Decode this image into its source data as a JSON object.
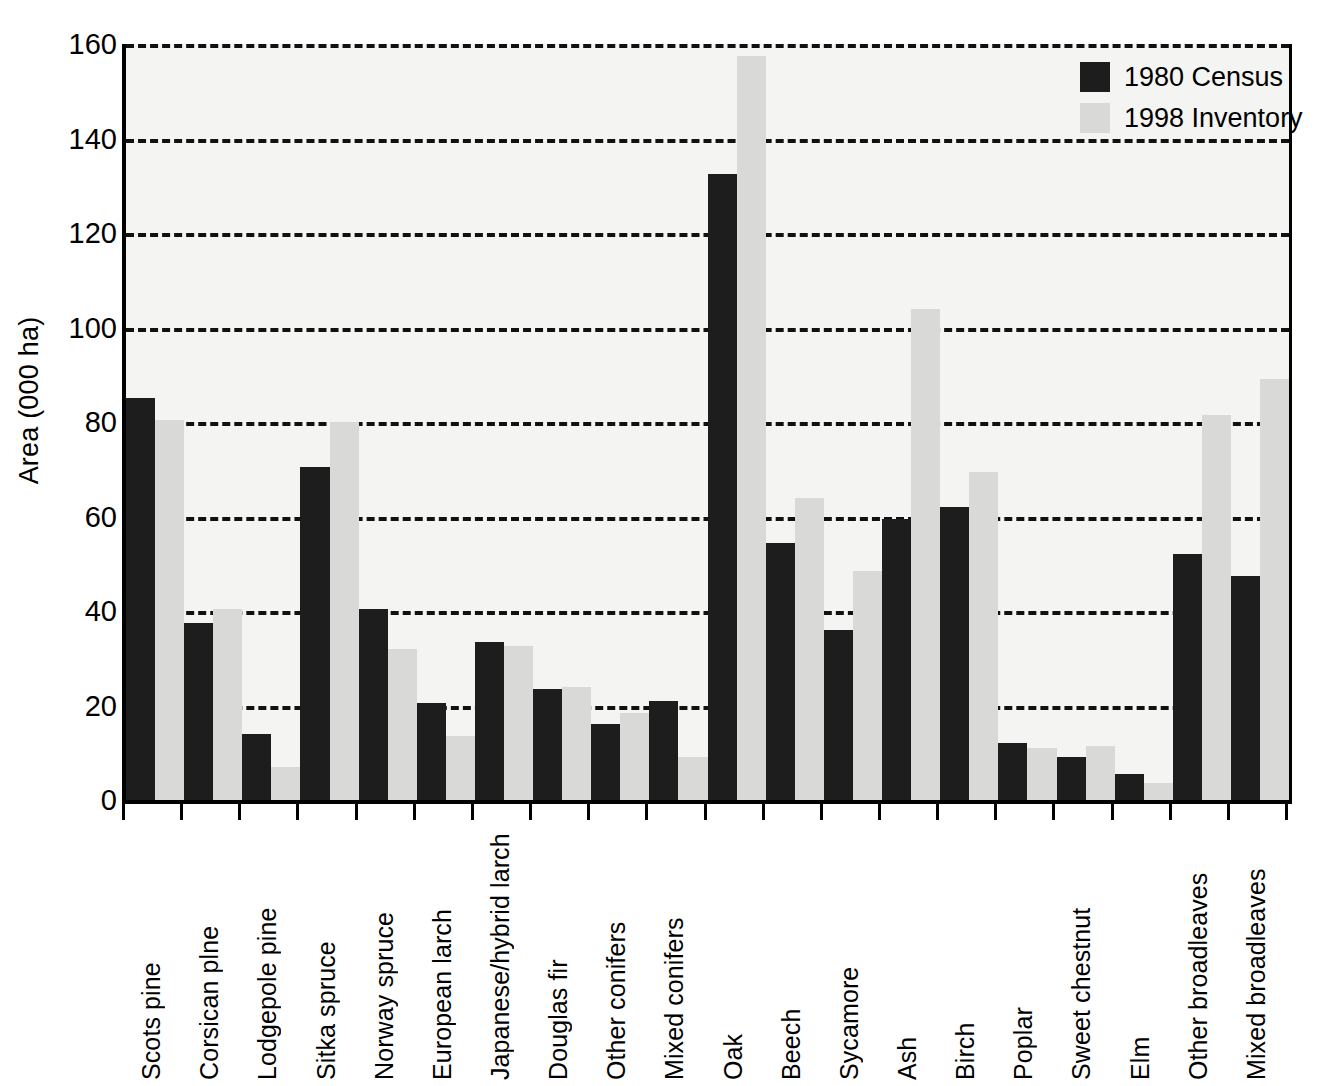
{
  "chart_data": {
    "type": "bar",
    "title": "",
    "xlabel": "",
    "ylabel": "Area (000 ha)",
    "ylim": [
      0,
      160
    ],
    "yticks": [
      0,
      20,
      40,
      60,
      80,
      100,
      120,
      140,
      160
    ],
    "ytick_labels": [
      "0",
      "20",
      "40",
      "60",
      "80",
      "100",
      "120",
      "140",
      "160"
    ],
    "grid": "horizontal-dashed",
    "legend_position": "top-right",
    "categories": [
      "Scots pine",
      "Corsican plne",
      "Lodgepole pine",
      "Sitka spruce",
      "Norway spruce",
      "European larch",
      "Japanese/hybrid larch",
      "Douglas fir",
      "Other conifers",
      "Mixed conifers",
      "Oak",
      "Beech",
      "Sycamore",
      "Ash",
      "Birch",
      "Poplar",
      "Sweet chestnut",
      "Elm",
      "Other broadleaves",
      "Mixed broadleaves"
    ],
    "series": [
      {
        "name": "1980 Census",
        "color": "#1d1d1d",
        "values": [
          85,
          37.5,
          14,
          70.5,
          40.5,
          20.5,
          33.5,
          23.5,
          16,
          21,
          132.5,
          54.5,
          36,
          59.5,
          62,
          12,
          9,
          5.5,
          52,
          47.5
        ]
      },
      {
        "name": "1998 Inventory",
        "color": "#d9d9d7",
        "values": [
          80.5,
          40.5,
          7,
          80,
          32,
          13.5,
          32.5,
          24,
          18.5,
          9,
          157.5,
          64,
          48.5,
          104,
          69.5,
          11,
          11.5,
          3.5,
          81.5,
          89
        ]
      }
    ]
  },
  "legend": {
    "items": [
      {
        "label": "1980 Census",
        "swatch": "series-1-swatch"
      },
      {
        "label": "1998 Inventory",
        "swatch": "series-2-swatch"
      }
    ]
  }
}
